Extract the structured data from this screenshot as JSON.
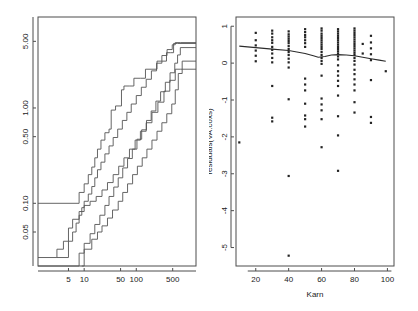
{
  "figure": {
    "background_color": "#ffffff",
    "width": 418,
    "height": 311,
    "panel_count": 2
  },
  "chart_data": [
    {
      "id": "left-panel",
      "type": "line",
      "subtype": "step",
      "title": "",
      "xlabel": "",
      "ylabel": "",
      "xscale": "log",
      "yscale": "log",
      "grid": false,
      "legend": "none",
      "xlim": [
        1.3,
        1400
      ],
      "ylim": [
        0.022,
        9.0
      ],
      "xticks": [
        5,
        10,
        50,
        100,
        500
      ],
      "xticklabels": [
        "5",
        "10",
        "50",
        "100",
        "500"
      ],
      "yticks": [
        0.05,
        0.1,
        0.5,
        1.0,
        5.0
      ],
      "yticklabels": [
        "0.05",
        "0.10",
        "0.50",
        "1.00",
        "5.00"
      ],
      "description": "Cumulative hazard step functions with confidence bands on log-log axes",
      "series": [
        {
          "name": "upper-band",
          "points": [
            [
              1.3,
              0.1
            ],
            [
              8,
              0.1
            ],
            [
              8,
              0.13
            ],
            [
              10,
              0.16
            ],
            [
              12,
              0.2
            ],
            [
              14,
              0.24
            ],
            [
              16,
              0.3
            ],
            [
              18,
              0.37
            ],
            [
              21,
              0.46
            ],
            [
              25,
              0.55
            ],
            [
              30,
              0.6
            ],
            [
              33,
              0.95
            ],
            [
              40,
              1.05
            ],
            [
              52,
              1.55
            ],
            [
              58,
              1.55
            ],
            [
              58,
              1.7
            ],
            [
              75,
              1.7
            ],
            [
              90,
              2.05
            ],
            [
              120,
              2.05
            ],
            [
              150,
              2.55
            ],
            [
              200,
              2.55
            ],
            [
              250,
              3.1
            ],
            [
              300,
              3.1
            ],
            [
              380,
              3.8
            ],
            [
              450,
              3.8
            ],
            [
              520,
              4.75
            ],
            [
              620,
              4.75
            ],
            [
              1400,
              4.75
            ]
          ]
        },
        {
          "name": "upper-inner",
          "points": [
            [
              3,
              0.027
            ],
            [
              5,
              0.027
            ],
            [
              5,
              0.04
            ],
            [
              6,
              0.05
            ],
            [
              7,
              0.062
            ],
            [
              8,
              0.075
            ],
            [
              9,
              0.09
            ],
            [
              10,
              0.105
            ],
            [
              12,
              0.125
            ],
            [
              14,
              0.15
            ],
            [
              16,
              0.185
            ],
            [
              18,
              0.225
            ],
            [
              21,
              0.27
            ],
            [
              25,
              0.33
            ],
            [
              30,
              0.4
            ],
            [
              36,
              0.49
            ],
            [
              44,
              0.6
            ],
            [
              54,
              0.74
            ],
            [
              66,
              0.9
            ],
            [
              80,
              1.1
            ],
            [
              100,
              1.35
            ],
            [
              125,
              1.65
            ],
            [
              155,
              2.0
            ],
            [
              195,
              2.45
            ],
            [
              245,
              2.95
            ],
            [
              310,
              3.55
            ],
            [
              390,
              4.1
            ],
            [
              490,
              4.6
            ],
            [
              560,
              4.85
            ],
            [
              700,
              4.85
            ],
            [
              1400,
              4.85
            ]
          ]
        },
        {
          "name": "fitted-center",
          "points": [
            [
              1.3,
              0.022
            ],
            [
              8,
              0.022
            ],
            [
              8,
              0.03
            ],
            [
              10,
              0.038
            ],
            [
              13,
              0.048
            ],
            [
              16,
              0.06
            ],
            [
              20,
              0.075
            ],
            [
              25,
              0.095
            ],
            [
              30,
              0.118
            ],
            [
              37,
              0.148
            ],
            [
              45,
              0.185
            ],
            [
              55,
              0.235
            ],
            [
              68,
              0.295
            ],
            [
              84,
              0.37
            ],
            [
              103,
              0.47
            ],
            [
              127,
              0.59
            ],
            [
              157,
              0.74
            ],
            [
              193,
              0.93
            ],
            [
              238,
              1.18
            ],
            [
              293,
              1.48
            ],
            [
              361,
              1.86
            ],
            [
              445,
              2.34
            ],
            [
              548,
              2.95
            ],
            [
              620,
              3.6
            ],
            [
              700,
              4.3
            ],
            [
              1400,
              4.3
            ]
          ]
        },
        {
          "name": "lower-inner",
          "points": [
            [
              9,
              0.022
            ],
            [
              10,
              0.022
            ],
            [
              10,
              0.033
            ],
            [
              14,
              0.042
            ],
            [
              18,
              0.05
            ],
            [
              22,
              0.058
            ],
            [
              28,
              0.07
            ],
            [
              35,
              0.085
            ],
            [
              45,
              0.105
            ],
            [
              55,
              0.13
            ],
            [
              68,
              0.16
            ],
            [
              85,
              0.2
            ],
            [
              105,
              0.245
            ],
            [
              130,
              0.3
            ],
            [
              160,
              0.37
            ],
            [
              200,
              0.46
            ],
            [
              250,
              0.57
            ],
            [
              310,
              0.7
            ],
            [
              385,
              0.87
            ],
            [
              480,
              1.1
            ],
            [
              560,
              1.55
            ],
            [
              640,
              2.3
            ],
            [
              760,
              3.1
            ],
            [
              1400,
              3.1
            ]
          ]
        },
        {
          "name": "lower-band",
          "points": [
            [
              1.3,
              0.027
            ],
            [
              3,
              0.027
            ],
            [
              3,
              0.033
            ],
            [
              4,
              0.04
            ],
            [
              5,
              0.055
            ],
            [
              6,
              0.068
            ],
            [
              8,
              0.082
            ],
            [
              10,
              0.095
            ],
            [
              13,
              0.105
            ],
            [
              17,
              0.118
            ],
            [
              22,
              0.138
            ],
            [
              28,
              0.165
            ],
            [
              36,
              0.2
            ],
            [
              46,
              0.245
            ],
            [
              58,
              0.3
            ],
            [
              74,
              0.37
            ],
            [
              95,
              0.46
            ],
            [
              120,
              0.57
            ],
            [
              155,
              0.7
            ],
            [
              200,
              0.9
            ],
            [
              260,
              1.15
            ],
            [
              340,
              1.5
            ],
            [
              440,
              1.95
            ],
            [
              560,
              2.55
            ],
            [
              700,
              2.55
            ],
            [
              1400,
              2.55
            ]
          ]
        }
      ]
    },
    {
      "id": "right-panel",
      "type": "scatter",
      "title": "",
      "xlabel": "Karn",
      "ylabel": "residuals(VA.coxs)",
      "grid": false,
      "legend": "none",
      "xlim": [
        8,
        104
      ],
      "ylim": [
        -5.5,
        1.25
      ],
      "xticks": [
        20,
        40,
        60,
        80,
        100
      ],
      "xticklabels": [
        "20",
        "40",
        "60",
        "80",
        "100"
      ],
      "yticks": [
        1,
        0,
        -1,
        -2,
        -3,
        -4,
        -5
      ],
      "yticklabels": [
        "1",
        "0",
        "-1",
        "-2",
        "-3",
        "-4",
        "-5"
      ],
      "description": "Martingale/deviance residuals against Karnofsky score with a lowess smoother",
      "points": [
        [
          10,
          -2.15
        ],
        [
          20,
          0.82
        ],
        [
          20,
          0.62
        ],
        [
          20,
          0.48
        ],
        [
          20,
          0.34
        ],
        [
          20,
          0.2
        ],
        [
          20,
          0.05
        ],
        [
          30,
          0.88
        ],
        [
          30,
          0.8
        ],
        [
          30,
          0.7
        ],
        [
          30,
          0.62
        ],
        [
          30,
          0.55
        ],
        [
          30,
          0.44
        ],
        [
          30,
          0.36
        ],
        [
          30,
          0.26
        ],
        [
          30,
          0.14
        ],
        [
          30,
          0.02
        ],
        [
          30,
          -0.62
        ],
        [
          30,
          -1.48
        ],
        [
          30,
          -1.58
        ],
        [
          40,
          0.86
        ],
        [
          40,
          0.78
        ],
        [
          40,
          0.72
        ],
        [
          40,
          0.66
        ],
        [
          40,
          0.6
        ],
        [
          40,
          0.54
        ],
        [
          40,
          0.46
        ],
        [
          40,
          0.38
        ],
        [
          40,
          0.3
        ],
        [
          40,
          0.22
        ],
        [
          40,
          0.12
        ],
        [
          40,
          0.02
        ],
        [
          40,
          -0.12
        ],
        [
          40,
          -0.98
        ],
        [
          40,
          -3.06
        ],
        [
          40,
          -5.22
        ],
        [
          50,
          0.92
        ],
        [
          50,
          0.84
        ],
        [
          50,
          0.76
        ],
        [
          50,
          0.7
        ],
        [
          50,
          0.62
        ],
        [
          50,
          0.54
        ],
        [
          50,
          0.44
        ],
        [
          50,
          -0.42
        ],
        [
          50,
          -0.58
        ],
        [
          50,
          -0.74
        ],
        [
          50,
          -1.1
        ],
        [
          50,
          -1.42
        ],
        [
          50,
          -1.52
        ],
        [
          50,
          -1.72
        ],
        [
          60,
          0.94
        ],
        [
          60,
          0.88
        ],
        [
          60,
          0.8
        ],
        [
          60,
          0.74
        ],
        [
          60,
          0.68
        ],
        [
          60,
          0.62
        ],
        [
          60,
          0.56
        ],
        [
          60,
          0.5
        ],
        [
          60,
          0.44
        ],
        [
          60,
          0.38
        ],
        [
          60,
          0.3
        ],
        [
          60,
          0.22
        ],
        [
          60,
          0.14
        ],
        [
          60,
          0.06
        ],
        [
          60,
          -0.02
        ],
        [
          60,
          -0.34
        ],
        [
          60,
          -0.96
        ],
        [
          60,
          -1.12
        ],
        [
          60,
          -1.28
        ],
        [
          60,
          -1.52
        ],
        [
          60,
          -2.28
        ],
        [
          70,
          0.92
        ],
        [
          70,
          0.86
        ],
        [
          70,
          0.8
        ],
        [
          70,
          0.74
        ],
        [
          70,
          0.68
        ],
        [
          70,
          0.62
        ],
        [
          70,
          0.56
        ],
        [
          70,
          0.5
        ],
        [
          70,
          0.44
        ],
        [
          70,
          0.38
        ],
        [
          70,
          0.32
        ],
        [
          70,
          0.26
        ],
        [
          70,
          0.18
        ],
        [
          70,
          0.1
        ],
        [
          70,
          -0.06
        ],
        [
          70,
          -0.22
        ],
        [
          70,
          -0.34
        ],
        [
          70,
          -0.48
        ],
        [
          70,
          -0.62
        ],
        [
          70,
          -0.88
        ],
        [
          70,
          -1.44
        ],
        [
          70,
          -1.96
        ],
        [
          70,
          -2.92
        ],
        [
          80,
          0.94
        ],
        [
          80,
          0.88
        ],
        [
          80,
          0.82
        ],
        [
          80,
          0.76
        ],
        [
          80,
          0.7
        ],
        [
          80,
          0.64
        ],
        [
          80,
          0.58
        ],
        [
          80,
          0.52
        ],
        [
          80,
          0.46
        ],
        [
          80,
          0.4
        ],
        [
          80,
          0.34
        ],
        [
          80,
          0.28
        ],
        [
          80,
          0.22
        ],
        [
          80,
          0.14
        ],
        [
          80,
          0.06
        ],
        [
          80,
          -0.04
        ],
        [
          80,
          -0.18
        ],
        [
          80,
          -0.3
        ],
        [
          80,
          -0.44
        ],
        [
          80,
          -0.58
        ],
        [
          80,
          -0.74
        ],
        [
          80,
          -1.06
        ],
        [
          80,
          -1.34
        ],
        [
          85,
          0.52
        ],
        [
          85,
          0.26
        ],
        [
          90,
          0.74
        ],
        [
          90,
          0.56
        ],
        [
          90,
          0.4
        ],
        [
          90,
          0.24
        ],
        [
          90,
          0.08
        ],
        [
          90,
          -0.46
        ],
        [
          90,
          -1.46
        ],
        [
          90,
          -1.62
        ],
        [
          99,
          -0.22
        ]
      ],
      "smoother": {
        "name": "lowess",
        "points": [
          [
            10,
            0.46
          ],
          [
            20,
            0.42
          ],
          [
            30,
            0.38
          ],
          [
            40,
            0.34
          ],
          [
            45,
            0.3
          ],
          [
            50,
            0.26
          ],
          [
            55,
            0.2
          ],
          [
            58,
            0.16
          ],
          [
            62,
            0.18
          ],
          [
            66,
            0.22
          ],
          [
            70,
            0.23
          ],
          [
            75,
            0.22
          ],
          [
            80,
            0.2
          ],
          [
            85,
            0.16
          ],
          [
            90,
            0.12
          ],
          [
            95,
            0.08
          ],
          [
            99,
            0.05
          ]
        ]
      }
    }
  ]
}
